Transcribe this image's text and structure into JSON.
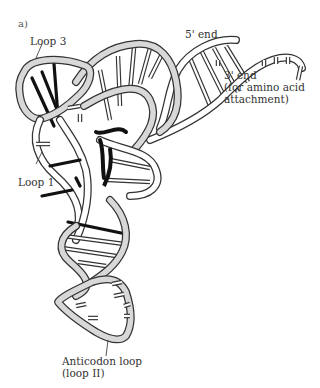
{
  "figure": {
    "panel_label": "a)",
    "labels": {
      "loop3": "Loop 3",
      "five_prime": "5' end",
      "three_prime_line1": "3' end",
      "three_prime_line2": "(for amino acid",
      "three_prime_line3": "attachment)",
      "loop1": "Loop 1",
      "anticodon_line1": "Anticodon loop",
      "anticodon_line2": "(loop II)"
    },
    "colors": {
      "outline": "#333333",
      "backbone_fill": "#d8d8d8",
      "tertiary_bonds": "#111111",
      "background": "#ffffff"
    }
  }
}
